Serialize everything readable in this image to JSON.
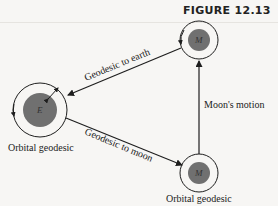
{
  "figure": {
    "title": "FIGURE 12.13",
    "bodies": {
      "earth": {
        "symbol": "E",
        "caption": "Orbital geodesic"
      },
      "moon_top": {
        "symbol": "M"
      },
      "moon_bottom": {
        "symbol": "M",
        "caption": "Orbital geodesic"
      }
    },
    "edges": {
      "moon_to_earth": "Geodesic to earth",
      "earth_to_moon": "Geodesic to moon",
      "moon_motion": "Moon's motion"
    },
    "colors": {
      "body_fill": "#707070",
      "line": "#1e1e1e",
      "background": "#f7f6f4"
    }
  }
}
